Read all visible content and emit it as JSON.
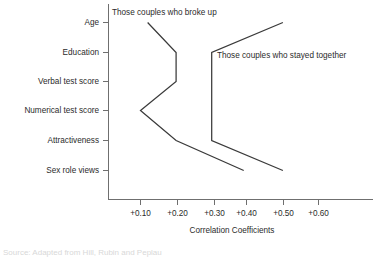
{
  "chart_data": {
    "type": "line",
    "orientation": "horizontal",
    "title": "",
    "xlabel": "Correlation Coefficients",
    "ylabel": "",
    "categories": [
      "Age",
      "Education",
      "Verbal test score",
      "Numerical test score",
      "Attractiveness",
      "Sex role views"
    ],
    "xticks": [
      0.1,
      0.2,
      0.3,
      0.4,
      0.5,
      0.6
    ],
    "xtick_labels": [
      "+0.10",
      "+0.20",
      "+0.30",
      "+0.40",
      "+0.50",
      "+0.60"
    ],
    "xlim": [
      0.04,
      0.65
    ],
    "grid": false,
    "legend_position": "inline-annotations",
    "series": [
      {
        "name": "Those couples who broke up",
        "values": [
          0.12,
          0.2,
          0.2,
          0.1,
          0.2,
          0.39
        ]
      },
      {
        "name": "Those couples who stayed together",
        "values": [
          0.5,
          0.3,
          0.3,
          0.3,
          0.3,
          0.5
        ]
      }
    ],
    "annotations": [
      {
        "text": "Those couples who broke up",
        "x": 0.125,
        "y_category": "Age",
        "placement": "above-left-line"
      },
      {
        "text": "Those couples who stayed together",
        "x": 0.315,
        "y_category": "Education",
        "placement": "right-of-line"
      }
    ]
  },
  "footer": {
    "partial_caption": "Source: Adapted from Hill, Rubin and Peplau"
  }
}
